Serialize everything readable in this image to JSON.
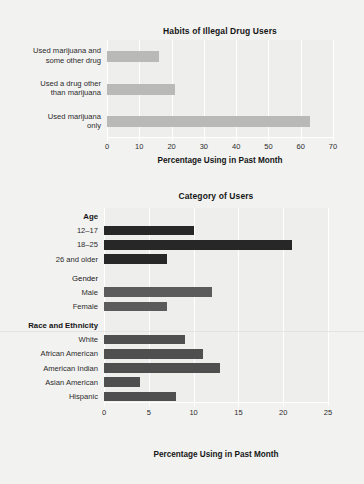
{
  "figure": {
    "background": "#f2f2f1"
  },
  "chart_data": [
    {
      "id": "habits",
      "type": "bar",
      "orientation": "horizontal",
      "title": "Habits of Illegal Drug Users",
      "xlabel": "Percentage Using in Past Month",
      "ylabel": "",
      "xlim": [
        0,
        70
      ],
      "xticks": [
        0,
        10,
        20,
        30,
        40,
        50,
        60,
        70
      ],
      "xticklabels": [
        "0",
        "10",
        "20",
        "30",
        "40",
        "50",
        "60",
        "70"
      ],
      "grid": true,
      "legend": "none",
      "bar_color": "#b9b9b7",
      "categories": [
        "Used marijuana and some other drug",
        "Used a drug other than marijuana",
        "Used marijuana only"
      ],
      "category_lines": [
        [
          "Used marijuana and",
          "some other drug"
        ],
        [
          "Used a drug other",
          "than marijuana"
        ],
        [
          "Used marijuana",
          "only"
        ]
      ],
      "values": [
        16,
        21,
        63
      ]
    },
    {
      "id": "category-of-users",
      "type": "bar",
      "orientation": "horizontal",
      "title": "Category of Users",
      "xlabel": "Percentage Using in Past Month",
      "ylabel": "",
      "xlim": [
        0,
        25
      ],
      "xticks": [
        0,
        5,
        10,
        15,
        20,
        25
      ],
      "xticklabels": [
        "0",
        "5",
        "10",
        "15",
        "20",
        "25"
      ],
      "grid": true,
      "legend": "none",
      "groups": [
        {
          "name": "Age",
          "bold": true,
          "color": "#272727",
          "categories": [
            "12–17",
            "18–25",
            "26 and older"
          ],
          "values": [
            10,
            21,
            7
          ]
        },
        {
          "name": "Gender",
          "bold": false,
          "color": "#5b5b5b",
          "categories": [
            "Male",
            "Female"
          ],
          "values": [
            12,
            7
          ]
        },
        {
          "name": "Race and Ethnicity",
          "bold": true,
          "color": "#4f4f4f",
          "categories": [
            "White",
            "African American",
            "American Indian",
            "Asian American",
            "Hispanic"
          ],
          "values": [
            9,
            11,
            13,
            4,
            8
          ]
        }
      ]
    }
  ]
}
